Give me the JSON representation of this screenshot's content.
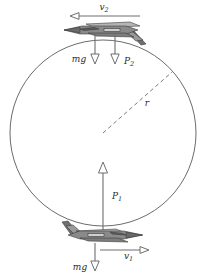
{
  "geometry": {
    "circle": {
      "cx": 103,
      "cy": 133,
      "r": 93
    },
    "radius_line": {
      "x1": 103,
      "y1": 133,
      "x2": 172,
      "y2": 72
    }
  },
  "colors": {
    "circle_stroke": "#5a5a5a",
    "vector_stroke": "#6e6e6e",
    "label_fill": "#2b2b2b",
    "jet_dark": "#4a4a4a",
    "jet_mid": "#8c8c8c",
    "jet_light": "#c8c8c8",
    "background": "#ffffff"
  },
  "labels": {
    "velocity_top": {
      "symbol": "v",
      "subscript": "2",
      "x": 108,
      "y": 10
    },
    "velocity_bottom": {
      "symbol": "v",
      "subscript": "1",
      "x": 128,
      "y": 256
    },
    "weight_top": {
      "symbol": "mg",
      "subscript": "",
      "x": 76,
      "y": 66
    },
    "weight_bottom": {
      "symbol": "mg",
      "subscript": "",
      "x": 80,
      "y": 269
    },
    "thrust_top": {
      "symbol": "P",
      "subscript": "2",
      "x": 124,
      "y": 67
    },
    "thrust_bottom": {
      "symbol": "P",
      "subscript": "1",
      "x": 112,
      "y": 195
    },
    "radius": {
      "symbol": "r",
      "subscript": "",
      "x": 147,
      "y": 106
    }
  },
  "vectors": {
    "v2_top": {
      "name": "velocity-top",
      "direction": "left",
      "x1": 140,
      "y1": 16,
      "x2": 70,
      "y2": 16
    },
    "v1_bottom": {
      "name": "velocity-bottom",
      "direction": "right",
      "x1": 103,
      "y1": 250,
      "x2": 147,
      "y2": 250
    },
    "mg_top": {
      "name": "weight-top",
      "direction": "down",
      "x1": 95,
      "y1": 33,
      "x2": 95,
      "y2": 63
    },
    "p2_top": {
      "name": "thrust-top",
      "direction": "down",
      "x1": 115,
      "y1": 33,
      "x2": 115,
      "y2": 63
    },
    "p1_bottom": {
      "name": "thrust-bottom",
      "direction": "up",
      "x1": 103,
      "y1": 236,
      "x2": 103,
      "y2": 162
    },
    "mg_bottom": {
      "name": "weight-bottom",
      "direction": "down",
      "x1": 95,
      "y1": 245,
      "x2": 95,
      "y2": 272
    }
  },
  "aircraft": [
    {
      "name": "jet-top",
      "position": "top-of-loop",
      "orientation": "inverted",
      "nose": "left",
      "cx": 103,
      "cy": 30
    },
    {
      "name": "jet-bottom",
      "position": "bottom-of-loop",
      "orientation": "upright",
      "nose": "right",
      "cx": 103,
      "cy": 235
    }
  ]
}
